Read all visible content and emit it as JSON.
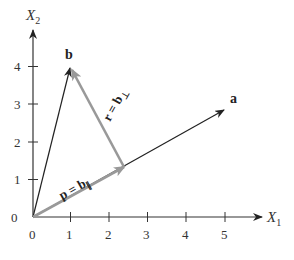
{
  "figure": {
    "x_axis": {
      "label": "X",
      "subscript": "1",
      "ticks": [
        "0",
        "1",
        "2",
        "3",
        "4",
        "5"
      ]
    },
    "y_axis": {
      "label": "X",
      "subscript": "2",
      "ticks": [
        "1",
        "2",
        "3",
        "4"
      ]
    },
    "vectors": {
      "a": {
        "label": "a",
        "end": [
          5.0,
          2.85
        ],
        "color": "#222222"
      },
      "b": {
        "label": "b",
        "end": [
          1,
          4
        ],
        "color": "#222222"
      },
      "p": {
        "label_main": "p = b",
        "label_sub": "∥",
        "end": [
          2.36,
          1.33
        ],
        "color": "#999999"
      },
      "r": {
        "label_main": "r = b",
        "label_sub": "⊥",
        "start": [
          2.36,
          1.33
        ],
        "end": [
          1,
          4
        ],
        "color": "#999999"
      }
    }
  }
}
